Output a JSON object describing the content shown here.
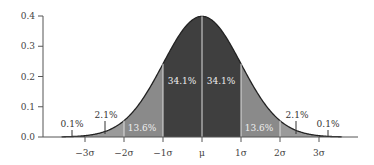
{
  "chart_data": {
    "type": "area",
    "title": "",
    "xlabel": "",
    "ylabel": "",
    "ylim": [
      0,
      0.4
    ],
    "xlim": [
      -3.5,
      3.5
    ],
    "y_ticks": [
      "0.0",
      "0.1",
      "0.2",
      "0.3",
      "0.4"
    ],
    "x_ticks": [
      "−3σ",
      "−2σ",
      "−1σ",
      "μ",
      "1σ",
      "2σ",
      "3σ"
    ],
    "grid": false,
    "distribution": "standard normal",
    "regions": [
      {
        "range": [
          -4,
          -3
        ],
        "percent": "0.1%",
        "color": "#3a3a3a"
      },
      {
        "range": [
          -3,
          -2
        ],
        "percent": "2.1%",
        "color": "#9a9a9a"
      },
      {
        "range": [
          -2,
          -1
        ],
        "percent": "13.6%",
        "color": "#8a8a8a"
      },
      {
        "range": [
          -1,
          0
        ],
        "percent": "34.1%",
        "color": "#3f3f3f"
      },
      {
        "range": [
          0,
          1
        ],
        "percent": "34.1%",
        "color": "#3f3f3f"
      },
      {
        "range": [
          1,
          2
        ],
        "percent": "13.6%",
        "color": "#8a8a8a"
      },
      {
        "range": [
          2,
          3
        ],
        "percent": "2.1%",
        "color": "#9a9a9a"
      },
      {
        "range": [
          3,
          4
        ],
        "percent": "0.1%",
        "color": "#3a3a3a"
      }
    ]
  },
  "labels": {
    "p01_left": "0.1%",
    "p21_left": "2.1%",
    "p136_left": "13.6%",
    "p341_left": "34.1%",
    "p341_right": "34.1%",
    "p136_right": "13.6%",
    "p21_right": "2.1%",
    "p01_right": "0.1%"
  },
  "axis": {
    "y": [
      "0.0",
      "0.1",
      "0.2",
      "0.3",
      "0.4"
    ],
    "x": [
      "−3σ",
      "−2σ",
      "−1σ",
      "μ",
      "1σ",
      "2σ",
      "3σ"
    ]
  }
}
